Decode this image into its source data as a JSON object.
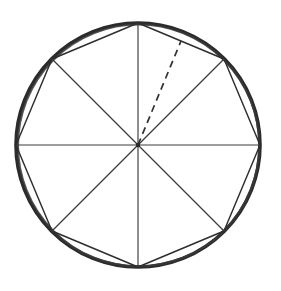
{
  "figure": {
    "background_color": "#ffffff",
    "stroke_color": "#2b2b2b",
    "thin_stroke_color": "#3c3c3c",
    "dashed_stroke_color": "#303030",
    "canvas": {
      "width": 281,
      "height": 291
    }
  },
  "chart_data": {
    "type": "scatter",
    "xlabel": "",
    "ylabel": "",
    "grid": false,
    "legend": null,
    "xlim": [
      0,
      281
    ],
    "ylim": [
      0,
      291
    ],
    "center": {
      "x": 138,
      "y": 145,
      "label": "center"
    },
    "circle": {
      "cx": 138,
      "cy": 145,
      "r": 122,
      "stroke_width": 3.6
    },
    "polygon": {
      "name": "regular octagon",
      "sides": 8,
      "circumradius": 122,
      "rotation_deg": -90,
      "vertices": [
        {
          "id": "top",
          "x": 138,
          "y": 23,
          "angle_deg": 90
        },
        {
          "id": "upper-right",
          "x": 224,
          "y": 59,
          "angle_deg": 45
        },
        {
          "id": "right",
          "x": 260,
          "y": 145,
          "angle_deg": 0
        },
        {
          "id": "lower-right",
          "x": 224,
          "y": 231,
          "angle_deg": -45
        },
        {
          "id": "bottom",
          "x": 138,
          "y": 267,
          "angle_deg": -90
        },
        {
          "id": "lower-left",
          "x": 52,
          "y": 231,
          "angle_deg": -135
        },
        {
          "id": "left",
          "x": 16,
          "y": 145,
          "angle_deg": 180
        },
        {
          "id": "upper-left",
          "x": 52,
          "y": 59,
          "angle_deg": 135
        }
      ]
    },
    "radii": [
      {
        "id": "radius-top",
        "x1": 138,
        "y1": 145,
        "x2": 138,
        "y2": 23
      },
      {
        "id": "radius-upper-right",
        "x1": 138,
        "y1": 145,
        "x2": 224,
        "y2": 59
      },
      {
        "id": "radius-right",
        "x1": 138,
        "y1": 145,
        "x2": 260,
        "y2": 145
      },
      {
        "id": "radius-lower-right",
        "x1": 138,
        "y1": 145,
        "x2": 224,
        "y2": 231
      },
      {
        "id": "radius-bottom",
        "x1": 138,
        "y1": 145,
        "x2": 138,
        "y2": 267
      },
      {
        "id": "radius-lower-left",
        "x1": 138,
        "y1": 145,
        "x2": 52,
        "y2": 231
      },
      {
        "id": "radius-left",
        "x1": 138,
        "y1": 145,
        "x2": 16,
        "y2": 145
      },
      {
        "id": "radius-upper-left",
        "x1": 138,
        "y1": 145,
        "x2": 52,
        "y2": 59
      }
    ],
    "dashed_segment": {
      "id": "apothem",
      "style": "dashed",
      "dash_length": 7,
      "gap_length": 5,
      "x1": 138,
      "y1": 145,
      "x2": 181,
      "y2": 41,
      "note": "segment from center to midpoint of the upper-right side"
    }
  }
}
